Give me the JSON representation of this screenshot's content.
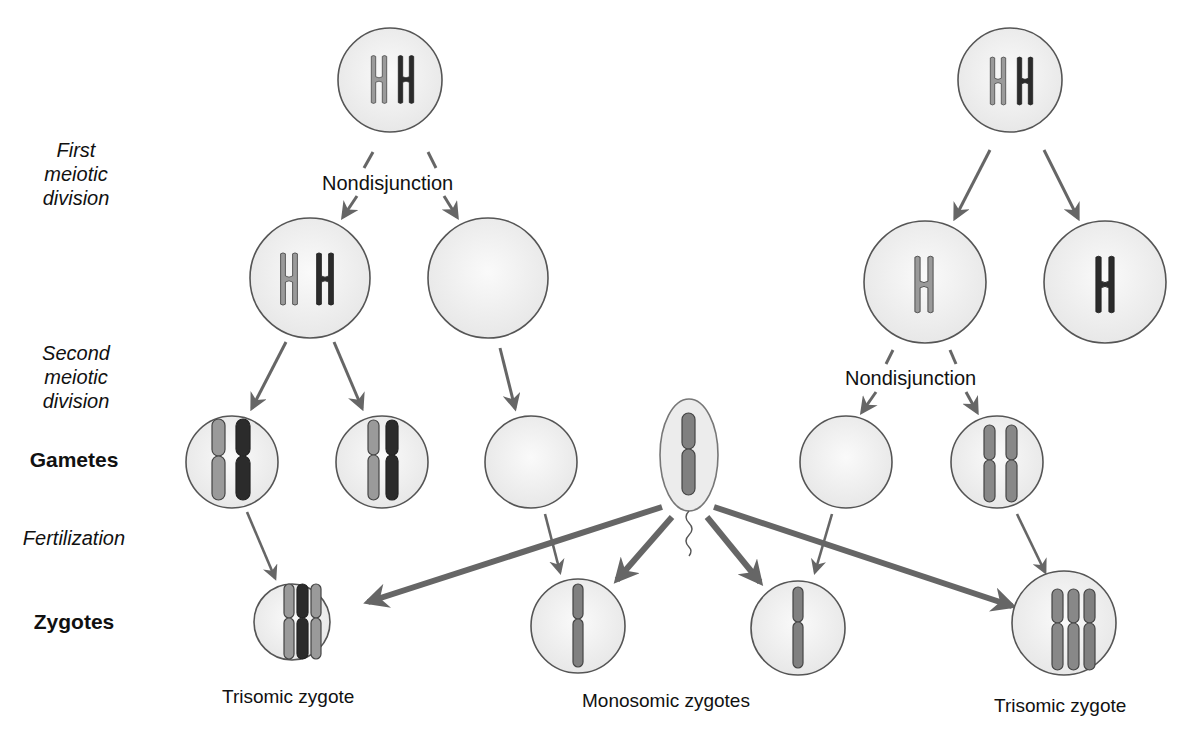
{
  "labels": {
    "stages": {
      "first_meiotic": [
        "First",
        "meiotic",
        "division"
      ],
      "second_meiotic": [
        "Second",
        "meiotic",
        "division"
      ],
      "gametes": "Gametes",
      "fertilization": "Fertilization",
      "zygotes": "Zygotes"
    },
    "nondisjunction_left": "Nondisjunction",
    "nondisjunction_right": "Nondisjunction",
    "captions": {
      "left_zygote": "Trisomic zygote",
      "middle_zygotes": "Monosomic zygotes",
      "right_zygote": "Trisomic zygote"
    }
  },
  "colors": {
    "light_chromosome": "#9a9a9a",
    "dark_chromosome": "#2b2b2b",
    "medium_chromosome": "#7d7d7d",
    "cell_fill": "#f1f1f1",
    "cell_stroke": "#555555",
    "arrow": "#666666"
  },
  "diagram": {
    "left_pathway": {
      "nondisjunction_at": "First meiotic division",
      "parent_cell": [
        "light",
        "dark"
      ],
      "after_first_division": [
        [
          "light",
          "dark"
        ],
        []
      ],
      "gametes": [
        [
          "light",
          "dark"
        ],
        [
          "light",
          "dark"
        ],
        []
      ],
      "zygotes": [
        {
          "chromosomes": 3,
          "type": "Trisomic zygote"
        },
        {
          "chromosomes": 1,
          "type": "Monosomic zygote"
        }
      ]
    },
    "sperm": {
      "chromosomes": 1
    },
    "right_pathway": {
      "nondisjunction_at": "Second meiotic division",
      "parent_cell": [
        "light",
        "dark"
      ],
      "after_first_division": [
        [
          "light"
        ],
        [
          "dark"
        ]
      ],
      "gametes": [
        [],
        [
          "medium",
          "medium"
        ]
      ],
      "zygotes": [
        {
          "chromosomes": 1,
          "type": "Monosomic zygote"
        },
        {
          "chromosomes": 3,
          "type": "Trisomic zygote"
        }
      ]
    }
  }
}
